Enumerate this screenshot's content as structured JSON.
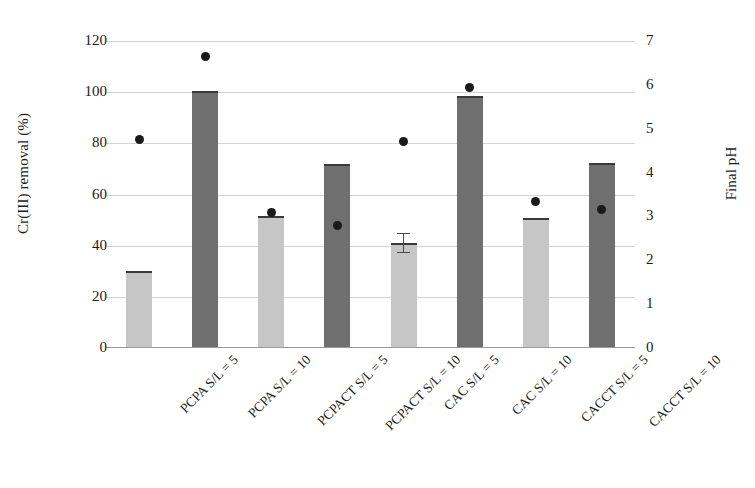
{
  "chart_data": {
    "type": "bar",
    "title": "",
    "categories": [
      "PCPA S/L = 5",
      "PCPA S/L = 10",
      "PCPACT S/L = 5",
      "PCPACT S/L = 10",
      "CAC S/L = 5",
      "CAC S/L = 10",
      "CACCT S/L = 5",
      "CACCT S/L = 10"
    ],
    "xlabel": "",
    "ylabel": "Cr(III) removal (%)",
    "y2label": "Final pH",
    "ylim": [
      0,
      120
    ],
    "y2lim": [
      0,
      7
    ],
    "yticks": [
      "0",
      "20",
      "40",
      "60",
      "80",
      "100",
      "120"
    ],
    "y2ticks": [
      "0",
      "1",
      "2",
      "3",
      "4",
      "5",
      "6",
      "7"
    ],
    "grid": true,
    "legend": "none",
    "series": [
      {
        "name": "Cr(III) removal (%)",
        "axis": "left",
        "kind": "bar",
        "values": [
          30.2,
          100.5,
          51.5,
          72.0,
          41.0,
          98.5,
          51.0,
          72.5
        ],
        "errors": [
          0,
          0,
          0,
          0,
          4.0,
          0,
          0,
          0
        ],
        "colors": [
          "#c6c6c6",
          "#6f6f6f",
          "#c6c6c6",
          "#6f6f6f",
          "#c6c6c6",
          "#6f6f6f",
          "#c6c6c6",
          "#6f6f6f"
        ]
      },
      {
        "name": "Final pH",
        "axis": "right",
        "kind": "scatter",
        "marker": "filled-circle",
        "color": "#1a1a1a",
        "values": [
          4.75,
          6.65,
          3.1,
          2.8,
          4.7,
          5.95,
          3.35,
          3.15
        ]
      }
    ]
  },
  "colors": {
    "bar_light": "#c6c6c6",
    "bar_dark": "#6f6f6f",
    "marker": "#1a1a1a",
    "gridline": "#d3d3d3",
    "axis": "#9a9a9a",
    "text": "#1c1c1c",
    "background": "#ffffff"
  }
}
